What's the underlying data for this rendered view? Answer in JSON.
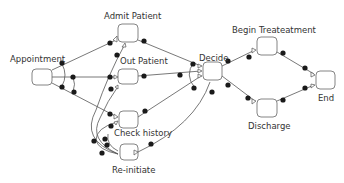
{
  "diagram": {
    "type": "process-flow",
    "nodes": [
      {
        "id": "appointment",
        "label": "Appointment"
      },
      {
        "id": "admit",
        "label": "Admit Patient"
      },
      {
        "id": "out",
        "label": "Out Patient"
      },
      {
        "id": "check",
        "label": "Check history"
      },
      {
        "id": "reinit",
        "label": "Re-initiate"
      },
      {
        "id": "decide",
        "label": "Decide"
      },
      {
        "id": "begin",
        "label": "Begin Treateatment"
      },
      {
        "id": "discharge",
        "label": "Discharge"
      },
      {
        "id": "end",
        "label": "End"
      }
    ],
    "edges": [
      {
        "from": "appointment",
        "to": "admit"
      },
      {
        "from": "appointment",
        "to": "out"
      },
      {
        "from": "appointment",
        "to": "check"
      },
      {
        "from": "admit",
        "to": "decide"
      },
      {
        "from": "out",
        "to": "decide"
      },
      {
        "from": "check",
        "to": "decide"
      },
      {
        "from": "reinit",
        "to": "decide"
      },
      {
        "from": "reinit",
        "to": "admit"
      },
      {
        "from": "reinit",
        "to": "out"
      },
      {
        "from": "reinit",
        "to": "check"
      },
      {
        "from": "decide",
        "to": "begin"
      },
      {
        "from": "decide",
        "to": "discharge"
      },
      {
        "from": "begin",
        "to": "end"
      },
      {
        "from": "discharge",
        "to": "end"
      }
    ],
    "colors": {
      "line": "#555555",
      "dot": "#1a1a1a",
      "box_stroke": "#666666",
      "text": "#333333"
    }
  }
}
